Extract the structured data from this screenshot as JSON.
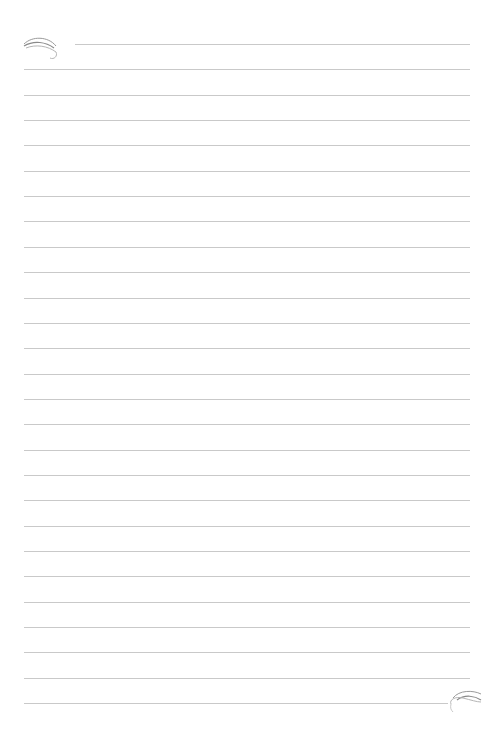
{
  "page": {
    "type": "lined-notebook-paper",
    "background_color": "#ffffff",
    "line_color": "#c9c9c9",
    "line_count": 27,
    "first_line_y": 44,
    "line_spacing": 25.35,
    "line_left": 24,
    "line_right": 470,
    "first_line_left": 75,
    "last_line_right": 448
  },
  "ornaments": [
    {
      "name": "top-left-swirl",
      "icon": "swirl-ornament"
    },
    {
      "name": "bottom-right-swirl",
      "icon": "swirl-ornament"
    }
  ]
}
